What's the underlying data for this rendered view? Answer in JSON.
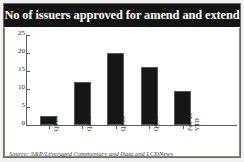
{
  "figure": {
    "title": "No of issuers approved for amend and extend",
    "source": "Source: S&P/Leveraged Commentary and Data and LCDNews",
    "title_bg_color": "#141414",
    "title_text_color": "#ffffff",
    "bar_color": "#171717",
    "frame_color": "#6c6a67",
    "axis_color": "#5d5b58"
  },
  "chart_data": {
    "type": "bar",
    "title": "No of issuers approved for amend and extend",
    "xlabel": "",
    "ylabel": "",
    "categories": [
      "Q1'09",
      "Q2'09",
      "Q3'09",
      "Q4'09",
      "Feb '10\nYTD"
    ],
    "values": [
      2.5,
      12,
      20,
      16,
      9.5
    ],
    "ylim": [
      0,
      25
    ],
    "yticks": [
      0,
      5,
      10,
      15,
      20,
      25
    ],
    "ytick_labels": [
      "0",
      "5",
      "10",
      "15",
      "20",
      "25"
    ],
    "grid": false,
    "legend": null,
    "series": [
      {
        "name": "No of issuers approved for amend and extend",
        "values": [
          2.5,
          12,
          20,
          16,
          9.5
        ]
      }
    ]
  }
}
